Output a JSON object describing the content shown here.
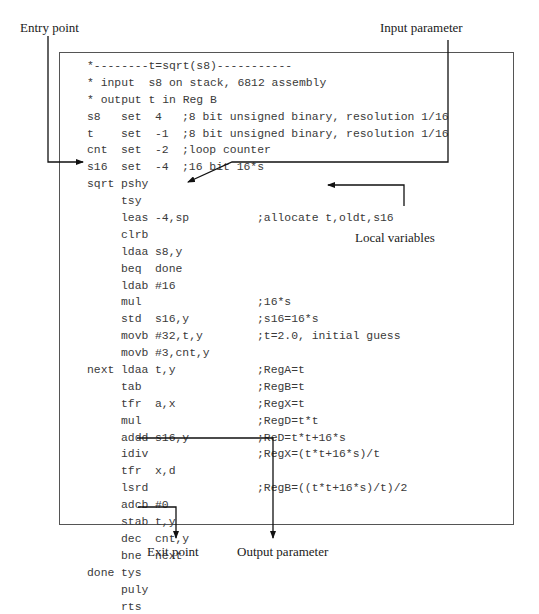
{
  "diagram": {
    "annotations": {
      "entry_point": "Entry point",
      "input_parameter": "Input parameter",
      "local_variables": "Local variables",
      "exit_point": "Exit point",
      "output_parameter": "Output parameter"
    },
    "code_lines": [
      {
        "label": "",
        "op": "",
        "arg": "",
        "comment": "*--------t=sqrt(s8)-----------",
        "raw": true
      },
      {
        "label": "",
        "op": "",
        "arg": "",
        "comment": "* input  s8 on stack, 6812 assembly",
        "raw": true
      },
      {
        "label": "",
        "op": "",
        "arg": "",
        "comment": "* output t in Reg B",
        "raw": true
      },
      {
        "label": "s8",
        "op": "set",
        "arg": "4",
        "comment": ";8 bit unsigned binary, resolution 1/16",
        "short": true
      },
      {
        "label": "t",
        "op": "set",
        "arg": "-1",
        "comment": ";8 bit unsigned binary, resolution 1/16",
        "short": true
      },
      {
        "label": "cnt",
        "op": "set",
        "arg": "-2",
        "comment": ";loop counter",
        "short": true
      },
      {
        "label": "s16",
        "op": "set",
        "arg": "-4",
        "comment": ";16 bit 16*s",
        "short": true
      },
      {
        "label": "sqrt",
        "op": "pshy",
        "arg": "",
        "comment": ""
      },
      {
        "label": "",
        "op": "tsy",
        "arg": "",
        "comment": ""
      },
      {
        "label": "",
        "op": "leas",
        "arg": "-4,sp",
        "comment": ";allocate t,oldt,s16"
      },
      {
        "label": "",
        "op": "clrb",
        "arg": "",
        "comment": ""
      },
      {
        "label": "",
        "op": "ldaa",
        "arg": "s8,y",
        "comment": ""
      },
      {
        "label": "",
        "op": "beq",
        "arg": "done",
        "comment": ""
      },
      {
        "label": "",
        "op": "ldab",
        "arg": "#16",
        "comment": ""
      },
      {
        "label": "",
        "op": "mul",
        "arg": "",
        "comment": ";16*s"
      },
      {
        "label": "",
        "op": "std",
        "arg": "s16,y",
        "comment": ";s16=16*s"
      },
      {
        "label": "",
        "op": "movb",
        "arg": "#32,t,y",
        "comment": ";t=2.0, initial guess"
      },
      {
        "label": "",
        "op": "movb",
        "arg": "#3,cnt,y",
        "comment": ""
      },
      {
        "label": "next",
        "op": "ldaa",
        "arg": "t,y",
        "comment": ";RegA=t"
      },
      {
        "label": "",
        "op": "tab",
        "arg": "",
        "comment": ";RegB=t"
      },
      {
        "label": "",
        "op": "tfr",
        "arg": "a,x",
        "comment": ";RegX=t"
      },
      {
        "label": "",
        "op": "mul",
        "arg": "",
        "comment": ";RegD=t*t"
      },
      {
        "label": "",
        "op": "addd",
        "arg": "s16,y",
        "comment": ";ReD=t*t+16*s"
      },
      {
        "label": "",
        "op": "idiv",
        "arg": "",
        "comment": ";RegX=(t*t+16*s)/t"
      },
      {
        "label": "",
        "op": "tfr",
        "arg": "x,d",
        "comment": ""
      },
      {
        "label": "",
        "op": "lsrd",
        "arg": "",
        "comment": ";RegB=((t*t+16*s)/t)/2"
      },
      {
        "label": "",
        "op": "adcb",
        "arg": "#0",
        "comment": ""
      },
      {
        "label": "",
        "op": "stab",
        "arg": "t,y",
        "comment": ""
      },
      {
        "label": "",
        "op": "dec",
        "arg": "cnt,y",
        "comment": ""
      },
      {
        "label": "",
        "op": "bne",
        "arg": "next",
        "comment": ""
      },
      {
        "label": "done",
        "op": "tys",
        "arg": "",
        "comment": ""
      },
      {
        "label": "",
        "op": "puly",
        "arg": "",
        "comment": ""
      },
      {
        "label": "",
        "op": "rts",
        "arg": "",
        "comment": ""
      }
    ],
    "colors": {
      "code_text": "#3a3a3a",
      "label_text": "#1a1a1a",
      "lines": "#111111",
      "box_border": "#555555"
    }
  }
}
